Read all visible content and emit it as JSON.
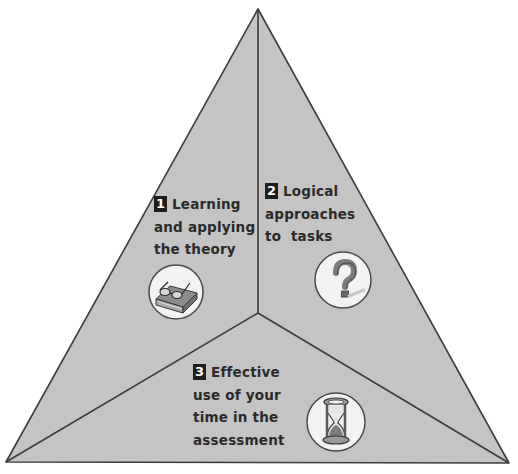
{
  "diagram": {
    "type": "triangle-three-segments",
    "colors": {
      "fill": "#c4c4c4",
      "stroke": "#3c3c3c",
      "label_box": "#1e1e1e",
      "icon_circle": "#f2f2f2"
    },
    "segments": [
      {
        "number": "1",
        "lines": [
          "Learning",
          "and applying",
          "the theory"
        ],
        "icon": "book-with-glasses-icon"
      },
      {
        "number": "2",
        "lines": [
          "Logical",
          "approaches",
          "to  tasks"
        ],
        "icon": "question-mark-icon"
      },
      {
        "number": "3",
        "lines": [
          "Effective",
          "use of your",
          "time in the",
          "assessment"
        ],
        "icon": "hourglass-icon"
      }
    ]
  }
}
